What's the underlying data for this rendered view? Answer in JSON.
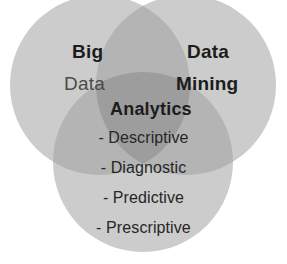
{
  "figure": {
    "type": "venn-diagram-3-set",
    "background_color": "#ffffff",
    "circle_fill_color": "#cccccc",
    "overlap_2way_color": "#b0b0b0",
    "overlap_3way_color": "#9a9a9a"
  },
  "sets": {
    "top_left": {
      "name": "big-data-set",
      "line1": "Big",
      "line2": "Data",
      "line1_color": "#1c1c1c",
      "line2_color": "#4a4a4a"
    },
    "top_right": {
      "name": "data-mining-set",
      "line1": "Data",
      "line2": "Mining",
      "line1_color": "#1c1c1c",
      "line2_color": "#1c1c1c"
    },
    "bottom": {
      "name": "analytics-set",
      "title": "Analytics",
      "title_color": "#1c1c1c",
      "items": [
        "- Descriptive",
        "- Diagnostic",
        "- Predictive",
        "- Prescriptive"
      ]
    }
  }
}
